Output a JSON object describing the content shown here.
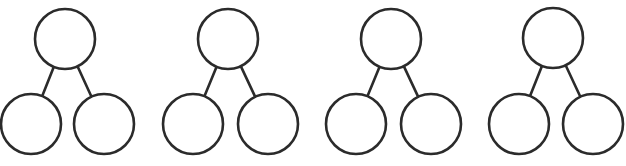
{
  "diagram": {
    "type": "number-bond",
    "count": 4,
    "stroke_color": "#2b2b2b",
    "background": "#ffffff",
    "bonds": [
      {
        "whole": {
          "cx": 65,
          "cy": 39,
          "r": 30,
          "value": ""
        },
        "parts": [
          {
            "cx": 31,
            "cy": 124,
            "r": 30,
            "value": ""
          },
          {
            "cx": 104,
            "cy": 124,
            "r": 30,
            "value": ""
          }
        ]
      },
      {
        "whole": {
          "cx": 228,
          "cy": 39,
          "r": 30,
          "value": ""
        },
        "parts": [
          {
            "cx": 193,
            "cy": 124,
            "r": 30,
            "value": ""
          },
          {
            "cx": 268,
            "cy": 124,
            "r": 30,
            "value": ""
          }
        ]
      },
      {
        "whole": {
          "cx": 391,
          "cy": 39,
          "r": 30,
          "value": ""
        },
        "parts": [
          {
            "cx": 356,
            "cy": 124,
            "r": 30,
            "value": ""
          },
          {
            "cx": 431,
            "cy": 124,
            "r": 30,
            "value": ""
          }
        ]
      },
      {
        "whole": {
          "cx": 553,
          "cy": 38,
          "r": 30,
          "value": ""
        },
        "parts": [
          {
            "cx": 519,
            "cy": 124,
            "r": 30,
            "value": ""
          },
          {
            "cx": 593,
            "cy": 124,
            "r": 30,
            "value": ""
          }
        ]
      }
    ]
  }
}
